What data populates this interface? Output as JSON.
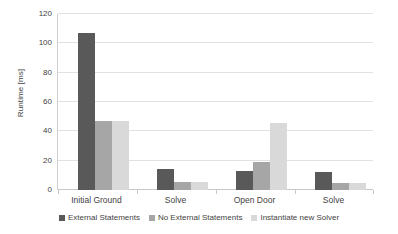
{
  "chart_data": {
    "type": "bar",
    "title": "",
    "xlabel": "",
    "ylabel": "Runtime [ms]",
    "ylim": [
      0,
      120
    ],
    "ytick_step": 20,
    "yticks": [
      0,
      20,
      40,
      60,
      80,
      100,
      120
    ],
    "ytick_labels": [
      "0",
      "20",
      "40",
      "60",
      "80",
      "100",
      "120"
    ],
    "categories": [
      "Initial Ground",
      "Solve",
      "Open Door",
      "Solve"
    ],
    "grid": "horizontal",
    "legend_position": "bottom",
    "series": [
      {
        "name": "External Statements",
        "color": "#595959",
        "values": [
          107,
          14,
          13,
          12
        ]
      },
      {
        "name": "No External Statements",
        "color": "#a6a6a6",
        "values": [
          47,
          5.5,
          19,
          5
        ]
      },
      {
        "name": "Instantiate new Solver",
        "color": "#d9d9d9",
        "values": [
          47,
          5.5,
          46,
          5
        ]
      }
    ]
  },
  "axis": {
    "y_title": "Runtime [ms]"
  },
  "legend": {
    "items": [
      {
        "label": "External Statements"
      },
      {
        "label": "No External Statements"
      },
      {
        "label": "Instantiate new Solver"
      }
    ]
  }
}
